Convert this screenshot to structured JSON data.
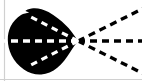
{
  "figure": {
    "title": "",
    "caption": "",
    "width": 142,
    "height": 81,
    "background_color": "#ffffff",
    "shape_color": "#000000",
    "ray_color_outside": "#000000",
    "ray_color_inside": "#ffffff",
    "border_color": "#c8c8c8"
  },
  "blob": {
    "name": "black-blob",
    "description": "solid black irregular rounded blob with pointed right tip",
    "fill": "#000000",
    "tip_x": 78,
    "tip_y": 41,
    "path": "M 78 41 L 66 26 L 58 17 L 48 11 L 36 8 L 25 10 L 27 13 L 22 14 L 15 20 L 10 29 L 8 38 L 9 48 L 13 57 L 20 65 L 29 71 L 40 74 L 51 72 L 60 66 L 68 57 L 74 49 Z"
  },
  "rays": {
    "origin": {
      "x": 78,
      "y": 41
    },
    "dash_pattern": "7 5",
    "stroke_width": 3.2,
    "outside": [
      {
        "name": "ray-upper-right",
        "x2": 144,
        "y2": 8,
        "angle_deg": -26.6,
        "color": "#000000"
      },
      {
        "name": "ray-right",
        "x2": 144,
        "y2": 41,
        "angle_deg": 0,
        "color": "#000000"
      },
      {
        "name": "ray-lower-right",
        "x2": 144,
        "y2": 74,
        "angle_deg": 26.6,
        "color": "#000000"
      }
    ],
    "inside": [
      {
        "name": "ray-upper-left",
        "x2": 28,
        "y2": 13,
        "angle_deg": 152.5,
        "color": "#ffffff"
      },
      {
        "name": "ray-left",
        "x2": 2,
        "y2": 41,
        "angle_deg": 180,
        "color": "#ffffff"
      },
      {
        "name": "ray-lower-left",
        "x2": 28,
        "y2": 69,
        "angle_deg": -152.5,
        "color": "#ffffff"
      }
    ]
  },
  "borders": {
    "left_line": {
      "name": "left-border-line",
      "x": 4,
      "color": "#d0d0d0"
    },
    "bottom_line": {
      "name": "bottom-border-line",
      "y": 79,
      "color": "#d0d0d0"
    }
  }
}
